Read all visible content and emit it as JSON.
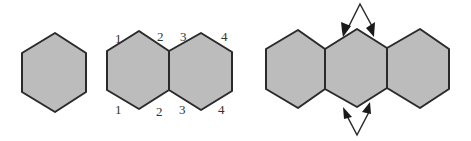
{
  "diagram": {
    "panels": [
      {
        "id": "single-hexagon",
        "hexagons": 1
      },
      {
        "id": "hexagon-pair-labeled",
        "hexagons": 2,
        "top_labels": [
          "1",
          "2",
          "3",
          "4"
        ],
        "bottom_labels": [
          "1",
          "2",
          "3",
          "4"
        ]
      },
      {
        "id": "hexagon-triple-with-arrows",
        "hexagons": 3,
        "arrows": [
          "top-diverging-arrows",
          "bottom-diverging-arrows"
        ]
      }
    ],
    "colors": {
      "hex_fill": "#bcbcbc",
      "stroke": "#2a2a2a",
      "label": "#333333"
    }
  }
}
